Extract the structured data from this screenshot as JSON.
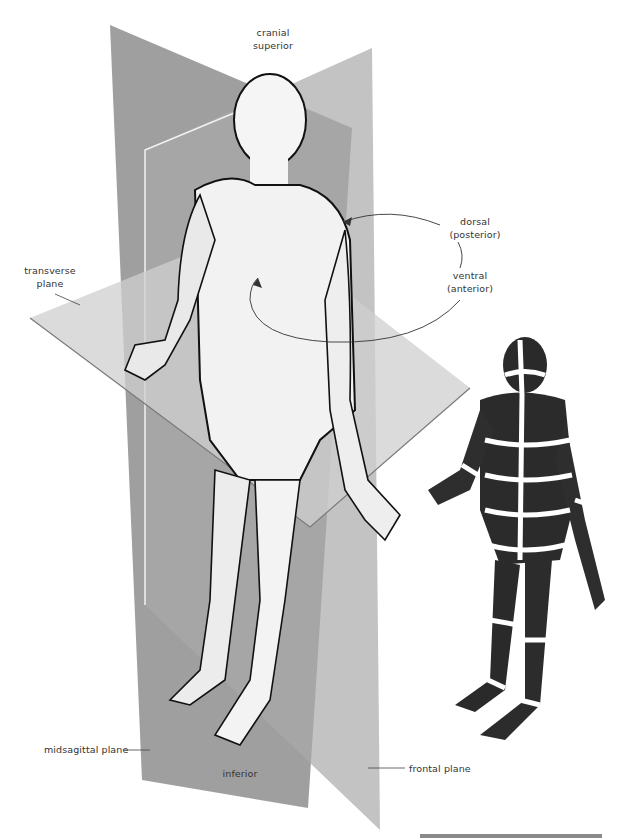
{
  "diagram": {
    "labels": {
      "cranial": "cranial",
      "superior": "superior",
      "dorsal": "dorsal",
      "posterior": "(posterior)",
      "ventral": "ventral",
      "anterior": "(anterior)",
      "transverse": "transverse",
      "transverse_plane": "plane",
      "midsagittal_plane": "midsagittal plane",
      "inferior": "inferior",
      "frontal_plane": "frontal plane"
    },
    "planes": [
      {
        "name": "midsagittal plane",
        "color": "#8c8c8c"
      },
      {
        "name": "frontal plane",
        "color": "#a8a8a8"
      },
      {
        "name": "transverse plane",
        "color": "#c4c4c4"
      }
    ],
    "figures": [
      {
        "name": "main figure",
        "style": "light outlined human figure with sectional planes"
      },
      {
        "name": "sectioned figure",
        "style": "dark figure divided into segments by white bands"
      }
    ],
    "colors": {
      "background": "#ffffff",
      "text": "#333333",
      "skin": "#f4f4f4",
      "outline": "#111111",
      "dark_figure": "#2a2a2a",
      "rule": "#8a8a8a"
    }
  }
}
